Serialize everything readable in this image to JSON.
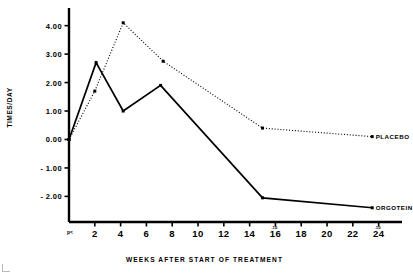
{
  "chart_data": {
    "type": "line",
    "title": "",
    "xlabel": "WEEKS AFTER START OF TREATMENT",
    "ylabel": "TIMES/DAY",
    "xlim": [
      0,
      25.5
    ],
    "ylim": [
      -2.9,
      4.55
    ],
    "grid": false,
    "legend_position": "right-inline",
    "xticks": [
      2,
      4,
      6,
      8,
      10,
      12,
      14,
      16,
      18,
      20,
      22,
      24
    ],
    "xticklabels": [
      "2",
      "4",
      "6",
      "8",
      "10",
      "12",
      "14",
      "16",
      "18",
      "20",
      "22",
      "24"
    ],
    "yticks": [
      -2,
      -1,
      0,
      1,
      2,
      3,
      4
    ],
    "yticklabels": [
      "- 2.00",
      "- 1.00",
      "0.00",
      "1.00",
      "2.00",
      "3.00",
      "4.00"
    ],
    "origin_annotation": "p<",
    "annotations": [
      {
        "text": ".10",
        "x": 16,
        "note": "significance marker above week 16"
      },
      {
        "text": ".10",
        "x": 24,
        "note": "significance marker above week 24"
      }
    ],
    "series": [
      {
        "name": "PLACEBO",
        "style": "dotted",
        "marker": "square",
        "x": [
          0,
          2,
          4.2,
          7.3,
          15,
          23.5
        ],
        "values": [
          0.0,
          1.7,
          4.1,
          2.75,
          0.4,
          0.1
        ]
      },
      {
        "name": "ORGOTEIN",
        "style": "solid",
        "marker": "square",
        "x": [
          0,
          2.1,
          4.2,
          7.1,
          15,
          23.5
        ],
        "values": [
          0.0,
          2.7,
          1.0,
          1.9,
          -2.05,
          -2.4
        ]
      }
    ]
  }
}
